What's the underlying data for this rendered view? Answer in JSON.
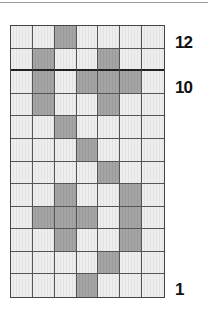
{
  "diagram": {
    "columns": 7,
    "rows": 12,
    "row_labels": [
      {
        "row": 12,
        "text": "12"
      },
      {
        "row": 10,
        "text": "10"
      },
      {
        "row": 1,
        "text": "1"
      }
    ],
    "thick_line_below_row": 11,
    "filled_cells": {
      "12": [
        3
      ],
      "11": [
        2,
        5
      ],
      "10": [
        2,
        4,
        5,
        6
      ],
      "9": [
        2,
        5
      ],
      "8": [
        3
      ],
      "7": [
        4
      ],
      "6": [
        5
      ],
      "5": [
        3,
        6
      ],
      "4": [
        2,
        3,
        4,
        6
      ],
      "3": [
        3,
        6
      ],
      "2": [
        5
      ],
      "1": [
        4
      ]
    },
    "colors": {
      "filled": "#a0a0a0",
      "empty": "#eaeaea",
      "gridline": "#555555"
    }
  }
}
